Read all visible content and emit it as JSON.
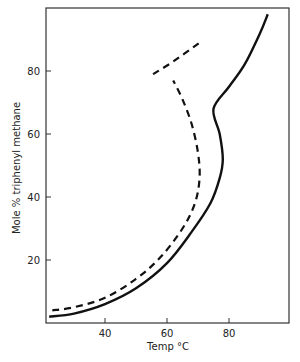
{
  "chart_data": {
    "type": "line",
    "title": "",
    "xlabel": "Temp °C",
    "ylabel": "Mole % triphenyl methane",
    "xlim": [
      20,
      97
    ],
    "ylim": [
      0,
      102
    ],
    "x_ticks": [
      40,
      60,
      80
    ],
    "y_ticks": [
      20,
      40,
      60,
      80
    ],
    "grid": false,
    "legend": null,
    "series": [
      {
        "name": "solid curve",
        "style": "solid",
        "points": [
          [
            22,
            2
          ],
          [
            30,
            3
          ],
          [
            40,
            6
          ],
          [
            50,
            11
          ],
          [
            60,
            19
          ],
          [
            68,
            29
          ],
          [
            74,
            38
          ],
          [
            77,
            46
          ],
          [
            78,
            52
          ],
          [
            77,
            60
          ],
          [
            75,
            68
          ],
          [
            80,
            75
          ],
          [
            85,
            82
          ],
          [
            90,
            92
          ],
          [
            92.5,
            98
          ]
        ]
      },
      {
        "name": "dashed curve",
        "style": "dashed",
        "points": [
          [
            23,
            4
          ],
          [
            30,
            5
          ],
          [
            40,
            8
          ],
          [
            50,
            14
          ],
          [
            58,
            21
          ],
          [
            65,
            30
          ],
          [
            69,
            38
          ],
          [
            70.5,
            46
          ],
          [
            70,
            54
          ],
          [
            68,
            63
          ],
          [
            65,
            71
          ],
          [
            62,
            77
          ]
        ]
      },
      {
        "name": "dashed segment",
        "style": "dashed",
        "points": [
          [
            55.5,
            79
          ],
          [
            62,
            83
          ],
          [
            70.5,
            89
          ]
        ]
      }
    ]
  },
  "axes": {
    "x_tick_labels": [
      "40",
      "60",
      "80"
    ],
    "y_tick_labels": [
      "20",
      "40",
      "60",
      "80"
    ],
    "x_title": "Temp °C",
    "y_title": "Mole % triphenyl methane"
  }
}
